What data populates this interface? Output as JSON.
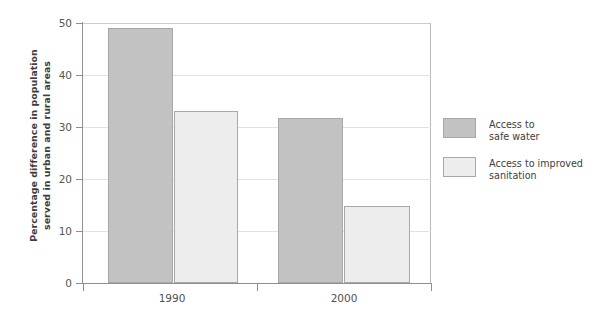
{
  "chart_data": {
    "type": "bar",
    "title": "",
    "subtitle": "",
    "xlabel": "",
    "ylabel": "Percentage difference in population served in urban and rural areas",
    "ylabel_line1": "Percentage difference in population",
    "ylabel_line2": "served in urban and rural areas",
    "categories": [
      "1990",
      "2000"
    ],
    "series": [
      {
        "name": "Access to safe water",
        "name_line1": "Access to",
        "name_line2": "safe water",
        "color": "#c2c2c2",
        "border_color": "#a8a8a8",
        "values": [
          49,
          31.7
        ]
      },
      {
        "name": "Access to improved sanitation",
        "name_line1": "Access to improved",
        "name_line2": "sanitation",
        "color": "#ededed",
        "border_color": "#a8a8a8",
        "values": [
          33,
          14.8
        ]
      }
    ],
    "ylim": [
      0,
      50
    ],
    "ytick_values": [
      0,
      10,
      20,
      30,
      40,
      50
    ],
    "ytick_labels": [
      "0",
      "10",
      "20",
      "30",
      "40",
      "50"
    ],
    "grid": true,
    "grid_axis": "y",
    "grid_color": "#e2e2e2",
    "legend_position": "right",
    "axis_color": "#8f8f8f",
    "background": "#ffffff"
  },
  "legend": {
    "items": [
      {
        "label_line1": "Access to",
        "label_line2": "safe water"
      },
      {
        "label_line1": "Access to improved",
        "label_line2": "sanitation"
      }
    ]
  },
  "axes": {
    "y_title_line1": "Percentage difference in population",
    "y_title_line2": "served in urban and rural areas",
    "y_ticks": [
      "50",
      "40",
      "30",
      "20",
      "10",
      "0"
    ],
    "x_ticks": [
      "1990",
      "2000"
    ]
  }
}
